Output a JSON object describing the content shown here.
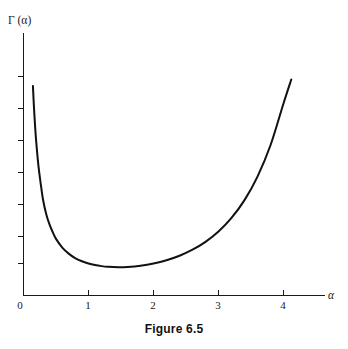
{
  "figure": {
    "caption": "Figure 6.5",
    "background_color": "#ffffff",
    "curve_color": "#111111",
    "axis_color": "#1a1a1a"
  },
  "chart_data": {
    "type": "line",
    "title": "",
    "subtitle": "",
    "xlabel": "α",
    "ylabel": "Γ (α)",
    "legend": [],
    "legend_position": "none",
    "grid": false,
    "xlim": [
      0,
      4.65
    ],
    "ylim": [
      0,
      7.0
    ],
    "x_ticks": [
      0,
      1,
      2,
      3,
      4
    ],
    "x_tick_labels": [
      "0",
      "1",
      "2",
      "3",
      "4"
    ],
    "y_ticks": [
      1,
      2,
      3,
      4,
      5,
      6,
      7
    ],
    "y_tick_labels": [
      "",
      "",
      "",
      "",
      "",
      "",
      ""
    ],
    "annotations": [],
    "series": [
      {
        "name": "Gamma function",
        "x": [
          0.145,
          0.16,
          0.18,
          0.2,
          0.23,
          0.26,
          0.3,
          0.35,
          0.4,
          0.45,
          0.5,
          0.6,
          0.7,
          0.8,
          0.9,
          1.0,
          1.1,
          1.2,
          1.3,
          1.4616,
          1.6,
          1.8,
          2.0,
          2.2,
          2.4,
          2.6,
          2.8,
          3.0,
          3.2,
          3.4,
          3.6,
          3.8,
          4.0,
          4.12
        ],
        "y": [
          6.55,
          5.92,
          5.24,
          4.7,
          4.05,
          3.57,
          3.0,
          2.54,
          2.22,
          1.98,
          1.77,
          1.49,
          1.3,
          1.16,
          1.07,
          1.0,
          0.951,
          0.918,
          0.898,
          0.8856,
          0.894,
          0.931,
          1.0,
          1.102,
          1.242,
          1.43,
          1.676,
          2.0,
          2.424,
          2.981,
          3.717,
          4.694,
          6.0,
          6.75
        ]
      }
    ]
  },
  "labels": {
    "y_axis_label": "Γ (α)",
    "x_axis_label": "α",
    "x_tick_0": "0",
    "x_tick_1": "1",
    "x_tick_2": "2",
    "x_tick_3": "3",
    "x_tick_4": "4"
  }
}
